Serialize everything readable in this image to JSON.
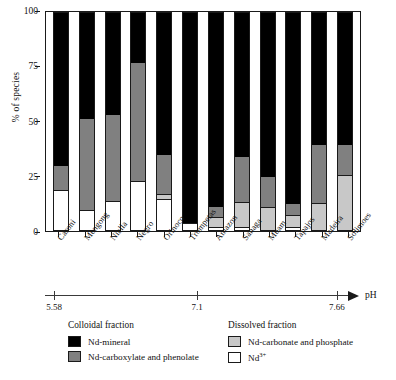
{
  "chart_data": {
    "type": "bar",
    "subtype": "stacked-bar-100-percent",
    "title": "",
    "xlabel": "pH",
    "ylabel": "% of species",
    "ylim": [
      0,
      100
    ],
    "yticks": [
      0,
      25,
      50,
      75,
      100
    ],
    "grid": false,
    "legend_position": "below-axis",
    "categories": [
      "Caroni",
      "Mengong",
      "Nialla",
      "Negro",
      "Orinoco",
      "Trompetas",
      "Amazon",
      "Sanaga",
      "Mbam",
      "Tapajos",
      "Madeira",
      "Solimoes"
    ],
    "ph_axis": {
      "ticks": [
        5.58,
        7.1,
        7.66
      ],
      "tick_labels": [
        "5.58",
        "7.1",
        "7.66"
      ],
      "tick_positions_pct": [
        3,
        50,
        96
      ],
      "arrow": true,
      "label": "pH"
    },
    "series": [
      {
        "name": "Nd-mineral",
        "group": "Colloidal fraction",
        "color": "#000000",
        "values": [
          71,
          49,
          47,
          23,
          66,
          97,
          90,
          67,
          76,
          89,
          61,
          61
        ]
      },
      {
        "name": "Nd-carboxylate and phenolate",
        "group": "Colloidal fraction",
        "color": "#808080",
        "values": [
          11,
          42,
          40,
          55,
          18,
          0,
          5,
          21,
          14,
          5,
          27,
          14
        ]
      },
      {
        "name": "Nd-carbonate and phosphate",
        "group": "Dissolved fraction",
        "color": "#c8c8c8",
        "values": [
          0,
          0,
          0,
          0,
          2,
          0,
          4,
          11,
          10,
          5,
          12,
          25
        ]
      },
      {
        "name": "Nd3+",
        "group": "Dissolved fraction",
        "color": "#ffffff",
        "values": [
          18,
          9,
          13,
          22,
          14,
          3,
          1,
          1,
          0,
          1,
          0,
          0
        ]
      }
    ]
  },
  "axes": {
    "y_title": "% of species",
    "y_tick_labels": [
      "100",
      "75",
      "50",
      "25",
      "0"
    ],
    "x_axis_label": "pH",
    "ph_tick_labels": [
      "5.58",
      "7.1",
      "7.66"
    ]
  },
  "legend": {
    "colloidal": {
      "title": "Colloidal fraction",
      "items": [
        {
          "label": "Nd-mineral",
          "swatch": "mineral"
        },
        {
          "label": "Nd-carboxylate and phenolate",
          "swatch": "carbox"
        }
      ]
    },
    "dissolved": {
      "title": "Dissolved fraction",
      "items": [
        {
          "label": "Nd-carbonate and phosphate",
          "swatch": "carb"
        },
        {
          "label": "Nd",
          "sup": "3+",
          "swatch": "nd3"
        }
      ]
    }
  },
  "colors": {
    "nd_mineral": "#000000",
    "nd_carboxylate": "#808080",
    "nd_carbonate": "#c8c8c8",
    "nd_free_ion": "#ffffff",
    "axis": "#1a1a1a"
  }
}
